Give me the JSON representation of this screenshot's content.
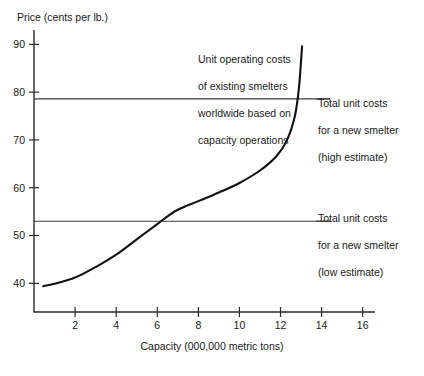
{
  "chart_data": {
    "type": "line",
    "title": "",
    "xlabel": "Capacity (000,000 metric tons)",
    "ylabel": "Price (cents per lb.)",
    "xlim": [
      0,
      16.6
    ],
    "ylim": [
      34,
      93
    ],
    "grid": false,
    "legend": "none",
    "xticks": [
      2,
      4,
      6,
      8,
      10,
      12,
      14,
      16
    ],
    "yticks": [
      40,
      50,
      60,
      70,
      80,
      90
    ],
    "series": [
      {
        "name": "Unit operating costs of existing smelters worldwide based on capacity operations",
        "x": [
          0.45,
          1.0,
          2.0,
          3.0,
          4.0,
          5.0,
          6.0,
          6.5,
          7.0,
          8.0,
          9.0,
          10.0,
          11.0,
          11.8,
          12.3,
          12.7,
          12.9,
          13.05
        ],
        "y": [
          39.4,
          39.9,
          41.2,
          43.4,
          46.0,
          49.2,
          52.4,
          54.0,
          55.4,
          57.2,
          59.0,
          61.0,
          63.6,
          66.6,
          69.8,
          75.0,
          81.0,
          89.6
        ]
      }
    ],
    "reference_lines": [
      {
        "name": "Total unit costs for a new smelter (high estimate)",
        "value": 78.6,
        "orientation": "horizontal"
      },
      {
        "name": "Total unit costs for a new smelter (low estimate)",
        "value": 53.0,
        "orientation": "horizontal"
      }
    ],
    "annotations": [
      {
        "name": "curve-annotation",
        "text": "Unit operating costs\nof existing smelters\nworldwide based on\ncapacity operations"
      },
      {
        "name": "high-estimate-annotation",
        "text": "Total unit costs\nfor a new smelter\n(high estimate)"
      },
      {
        "name": "low-estimate-annotation",
        "text": "Total unit costs\nfor a new smelter\n(low estimate)"
      }
    ]
  },
  "axes": {
    "y_axis_title": "Price (cents per lb.)",
    "x_axis_title": "Capacity (000,000 metric tons)",
    "y_tick_labels": [
      "90",
      "80",
      "70",
      "60",
      "50",
      "40"
    ],
    "x_tick_labels": [
      "2",
      "4",
      "6",
      "8",
      "10",
      "12",
      "14",
      "16"
    ]
  },
  "annotations": {
    "curve": {
      "line1": "Unit operating costs",
      "line2": "of existing smelters",
      "line3": "worldwide based on",
      "line4": "capacity operations"
    },
    "high_estimate": {
      "line1": "Total unit costs",
      "line2": "for a new smelter",
      "line3": "(high estimate)"
    },
    "low_estimate": {
      "line1": "Total unit costs",
      "line2": "for a new smelter",
      "line3": "(low estimate)"
    }
  },
  "colors": {
    "curve": "#111111",
    "axis": "#2b2b2b",
    "reference_line": "#3a3a3a",
    "background": "#ffffff"
  }
}
